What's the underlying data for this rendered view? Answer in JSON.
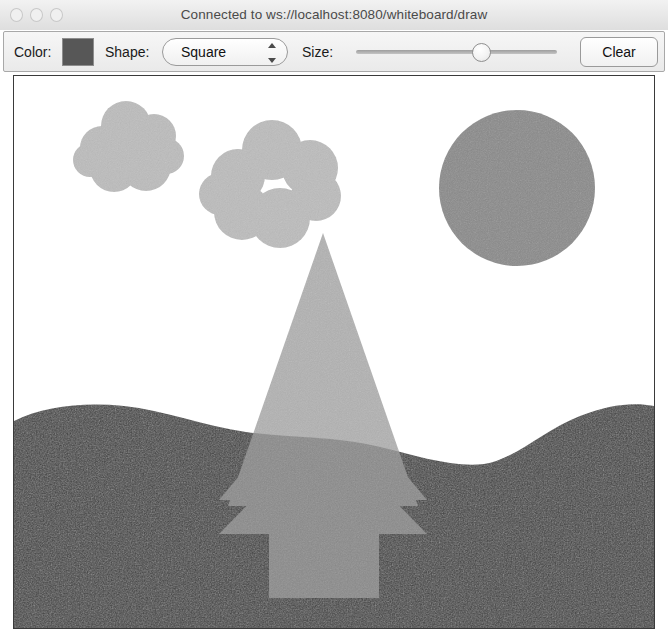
{
  "window": {
    "title": "Connected to ws://localhost:8080/whiteboard/draw",
    "traffic_lights": [
      "close",
      "minimize",
      "zoom"
    ]
  },
  "toolbar": {
    "color_label": "Color:",
    "color_value": "#575757",
    "shape_label": "Shape:",
    "shape_selected": "Square",
    "shape_options": [
      "Square",
      "Circle",
      "Triangle",
      "Line",
      "Freehand"
    ],
    "size_label": "Size:",
    "size_value": 64,
    "size_min": 0,
    "size_max": 100,
    "clear_label": "Clear"
  },
  "canvas": {
    "background": "#ffffff",
    "width": 640,
    "height": 552,
    "palette": {
      "cloud": "#b9b9b9",
      "sun": "#8a8a8a",
      "tree": "#9a9a9a",
      "ground": "#3f3f3f"
    },
    "shapes": [
      {
        "name": "cloud-left",
        "type": "cloud",
        "color": "#bcbcbc",
        "circles": [
          {
            "cx": 88,
            "cy": 72,
            "r": 22
          },
          {
            "cx": 112,
            "cy": 50,
            "r": 25
          },
          {
            "cx": 140,
            "cy": 60,
            "r": 22
          },
          {
            "cx": 100,
            "cy": 92,
            "r": 24
          },
          {
            "cx": 132,
            "cy": 90,
            "r": 25
          },
          {
            "cx": 150,
            "cy": 82,
            "r": 18
          }
        ]
      },
      {
        "name": "cloud-center",
        "type": "cloud",
        "color": "#bcbcbc",
        "circles": [
          {
            "cx": 224,
            "cy": 100,
            "r": 27
          },
          {
            "cx": 258,
            "cy": 74,
            "r": 30
          },
          {
            "cx": 296,
            "cy": 92,
            "r": 28
          },
          {
            "cx": 228,
            "cy": 136,
            "r": 28
          },
          {
            "cx": 266,
            "cy": 142,
            "r": 30
          },
          {
            "cx": 300,
            "cy": 122,
            "r": 24
          }
        ]
      },
      {
        "name": "sun-circle",
        "type": "circle",
        "color": "#8a8a8a",
        "cx": 503,
        "cy": 112,
        "r": 78
      },
      {
        "name": "tree-canopy-top",
        "type": "triangle",
        "color": "#9a9a9a",
        "apex_x": 309,
        "apex_y": 157,
        "half_width": 95,
        "base_y": 430
      },
      {
        "name": "tree-canopy-middle",
        "type": "triangle",
        "color": "#9a9a9a",
        "apex_x": 309,
        "apex_y": 300,
        "half_width": 104,
        "base_y": 424
      },
      {
        "name": "tree-canopy-bottom",
        "type": "triangle",
        "color": "#9a9a9a",
        "apex_x": 309,
        "apex_y": 352,
        "half_width": 104,
        "base_y": 458
      },
      {
        "name": "tree-trunk",
        "type": "rectangle",
        "color": "#9a9a9a",
        "x": 255,
        "y": 430,
        "width": 110,
        "height": 92
      },
      {
        "name": "ground-hill",
        "type": "ground",
        "color": "#3f3f3f",
        "description": "grassy undulating hill filling lower canvas"
      }
    ]
  }
}
